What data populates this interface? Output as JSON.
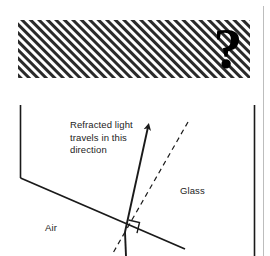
{
  "figure": {
    "type": "refraction-diagram",
    "background_color": "#ffffff",
    "ink_color": "#1a1a1a",
    "text_color": "#232323",
    "hatch_box": {
      "name": "masked-answer-region",
      "symbol": "?",
      "hatch_direction": "forward-slash",
      "x": 18,
      "y": 20,
      "width": 232,
      "height": 58
    },
    "labels": {
      "refracted_line_1": "Refracted light",
      "refracted_line_2": "travels in this",
      "refracted_line_3": "direction",
      "glass": "Glass",
      "air": "Air"
    },
    "annotations": {
      "right_angle_marker": "90",
      "incidence_point_x": 125,
      "incidence_point_y": 232
    },
    "rays": {
      "refracted_ray": "solid-arrow-up-right",
      "normal_line": "dashed",
      "incident_ray": "solid",
      "interface": "solid-diagonal"
    }
  }
}
